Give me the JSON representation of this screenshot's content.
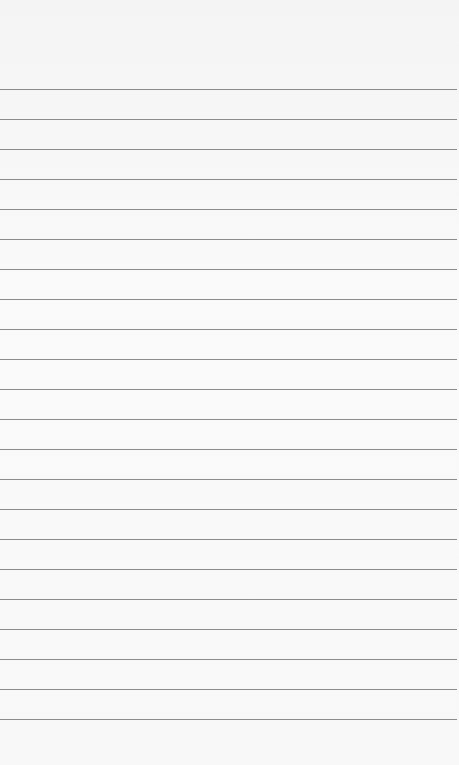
{
  "page": {
    "type": "lined-paper",
    "background_color": "#f7f7f7",
    "rule_color": "#8c8c8c",
    "first_rule_y": 89,
    "rule_spacing": 30,
    "rule_count": 22
  }
}
